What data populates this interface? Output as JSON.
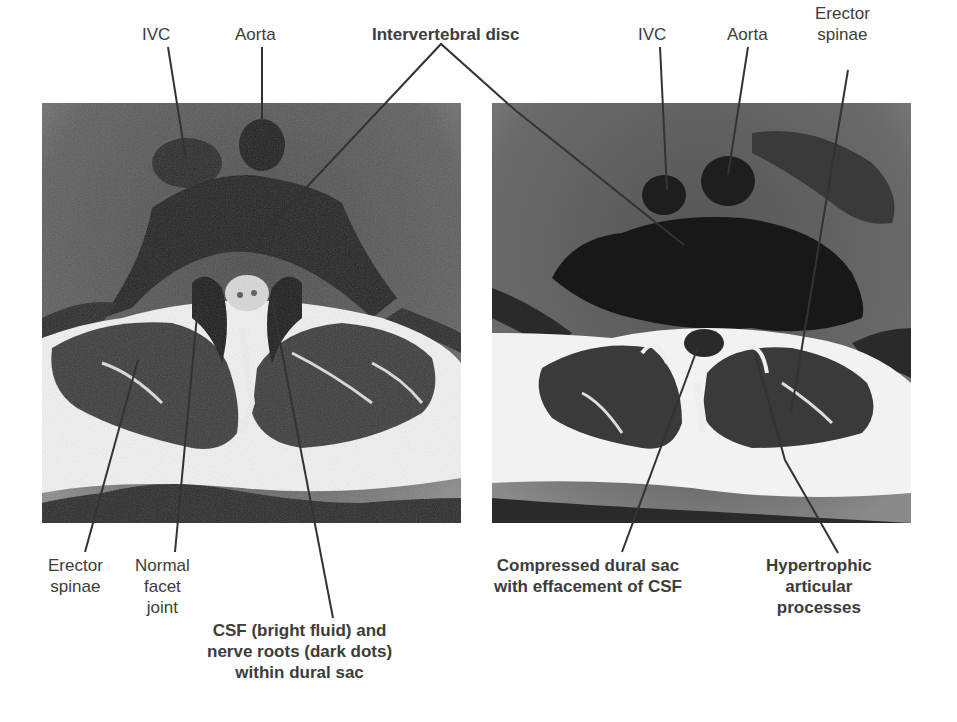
{
  "figure": {
    "panels": [
      {
        "id": "normal",
        "description": "Axial MRI of lumbar spine, normal",
        "labels_top": [
          {
            "text": "IVC"
          },
          {
            "text": "Aorta"
          }
        ],
        "labels_bottom": [
          {
            "text": "Erector\nspinae",
            "line1": "Erector",
            "line2": "spinae"
          },
          {
            "text": "Normal facet joint",
            "line1": "Normal",
            "line2": "facet",
            "line3": "joint"
          },
          {
            "text": "CSF (bright fluid) and nerve roots (dark dots) within dural sac",
            "line1": "CSF (bright fluid) and",
            "line2": "nerve roots (dark dots)",
            "line3": "within dural sac"
          }
        ]
      },
      {
        "id": "stenosis",
        "description": "Axial MRI of lumbar spine, spinal stenosis",
        "labels_top": [
          {
            "text": "IVC"
          },
          {
            "text": "Aorta"
          },
          {
            "text": "Erector spinae",
            "line1": "Erector",
            "line2": "spinae"
          }
        ],
        "labels_bottom": [
          {
            "text": "Compressed dural sac with effacement of CSF",
            "line1": "Compressed dural sac",
            "line2": "with effacement of CSF"
          },
          {
            "text": "Hypertrophic articular processes",
            "line1": "Hypertrophic",
            "line2": "articular",
            "line3": "processes"
          }
        ]
      }
    ],
    "shared_label": {
      "text": "Intervertebral disc"
    }
  },
  "colors": {
    "background": "#ffffff",
    "label_text": "#3c3c3c",
    "leader_line": "#333333",
    "mri_dark": "#1e1e1e",
    "mri_mid": "#5a5a5a",
    "mri_bright": "#f4f4f4"
  }
}
